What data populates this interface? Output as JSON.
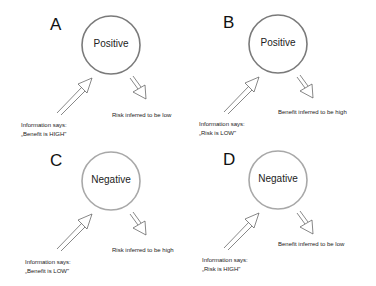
{
  "panels": [
    {
      "id": "A",
      "label": "A",
      "valence": "Positive",
      "circle_color": "#7a7a7a",
      "info_line1": "Information says:",
      "info_line2": "„Benefit is HIGH\"",
      "inference": "Risk inferred to be low"
    },
    {
      "id": "B",
      "label": "B",
      "valence": "Positive",
      "circle_color": "#7a7a7a",
      "info_line1": "Information says:",
      "info_line2": "„Risk is LOW\"",
      "inference": "Benefit inferred to be high"
    },
    {
      "id": "C",
      "label": "C",
      "valence": "Negative",
      "circle_color": "#a8a8a8",
      "info_line1": "Information says:",
      "info_line2": "„Benefit is LOW\"",
      "inference": "Risk inferred to be high"
    },
    {
      "id": "D",
      "label": "D",
      "valence": "Negative",
      "circle_color": "#a8a8a8",
      "info_line1": "Information says:",
      "info_line2": "„Risk is HIGH\"",
      "inference": "Benefit inferred to be low"
    }
  ]
}
